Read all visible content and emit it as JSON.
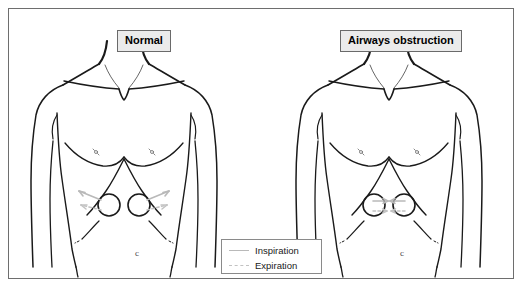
{
  "figure": {
    "caption_present": false,
    "colors": {
      "outline": "#1a1a1a",
      "frame_border": "#6e6e6e",
      "title_box_fill": "#ebebeb",
      "title_box_border": "#6a6a6a",
      "arrow_gray": "#b9b9b9",
      "legend_border": "#8a8a8a",
      "background": "#ffffff"
    },
    "panels": [
      {
        "id": "normal",
        "title": "Normal",
        "navel_mark": "c",
        "motion_direction": "outward",
        "arrow_count": 4
      },
      {
        "id": "obstruction",
        "title": "Airways obstruction",
        "navel_mark": "c",
        "motion_direction": "inward",
        "arrow_count": 4
      }
    ],
    "legend": {
      "items": [
        {
          "label": "Inspiration",
          "line_style": "solid"
        },
        {
          "label": "Expiration",
          "line_style": "dashed"
        }
      ]
    }
  }
}
